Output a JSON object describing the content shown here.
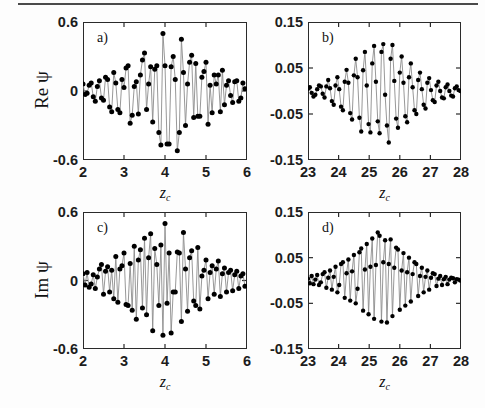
{
  "figure": {
    "background_color": "#fdfdfd",
    "rule_color": "#4a4a4a",
    "axis_color": "#2a2a2a",
    "marker_color": "#000000",
    "line_color": "#8c8c8c"
  },
  "panels": [
    {
      "letter": "a)",
      "ylabel": "Re",
      "ypsi": "ψ",
      "xlabel_base": "z",
      "xlabel_sub": "c",
      "yticks": [
        "0.6",
        "0",
        "-0.6"
      ],
      "ytick_values": [
        0.6,
        0,
        -0.6
      ],
      "xticks": [
        "2",
        "3",
        "4",
        "5",
        "6"
      ],
      "xtick_values": [
        2,
        3,
        4,
        5,
        6
      ]
    },
    {
      "letter": "b)",
      "ylabel": "",
      "ypsi": "",
      "xlabel_base": "z",
      "xlabel_sub": "c",
      "yticks": [
        "0.15",
        "0.05",
        "-0.05",
        "-0.15"
      ],
      "ytick_values": [
        0.15,
        0.05,
        -0.05,
        -0.15
      ],
      "xticks": [
        "23",
        "24",
        "25",
        "26",
        "27",
        "28"
      ],
      "xtick_values": [
        23,
        24,
        25,
        26,
        27,
        28
      ]
    },
    {
      "letter": "c)",
      "ylabel": "Im",
      "ypsi": "ψ",
      "xlabel_base": "z",
      "xlabel_sub": "c",
      "yticks": [
        "0.6",
        "0",
        "-0.6"
      ],
      "ytick_values": [
        0.6,
        0,
        -0.6
      ],
      "xticks": [
        "2",
        "3",
        "4",
        "5",
        "6"
      ],
      "xtick_values": [
        2,
        3,
        4,
        5,
        6
      ]
    },
    {
      "letter": "d)",
      "ylabel": "",
      "ypsi": "",
      "xlabel_base": "z",
      "xlabel_sub": "c",
      "yticks": [
        "0.15",
        "0.05",
        "-0.05",
        "-0.15"
      ],
      "ytick_values": [
        0.15,
        0.05,
        -0.05,
        -0.15
      ],
      "xticks": [
        "23",
        "24",
        "25",
        "26",
        "27",
        "28"
      ],
      "xtick_values": [
        23,
        24,
        25,
        26,
        27,
        28
      ]
    }
  ],
  "chart_data": [
    {
      "type": "scatter",
      "panel": "a)",
      "title": "",
      "xlabel": "z_c",
      "ylabel": "Re ψ",
      "xlim": [
        2,
        6
      ],
      "ylim": [
        -0.6,
        0.6
      ],
      "xticks": [
        2,
        3,
        4,
        5,
        6
      ],
      "yticks": [
        -0.6,
        0,
        0.6
      ],
      "grid": false,
      "legend": "none",
      "marker": "filled-circle",
      "connected": true,
      "x": [
        2.0,
        2.05,
        2.1,
        2.15,
        2.2,
        2.25,
        2.3,
        2.35,
        2.4,
        2.45,
        2.5,
        2.55,
        2.6,
        2.65,
        2.7,
        2.75,
        2.8,
        2.85,
        2.9,
        2.95,
        3.0,
        3.05,
        3.1,
        3.15,
        3.2,
        3.25,
        3.3,
        3.35,
        3.4,
        3.45,
        3.5,
        3.55,
        3.6,
        3.65,
        3.7,
        3.75,
        3.8,
        3.85,
        3.9,
        3.95,
        4.0,
        4.05,
        4.1,
        4.15,
        4.2,
        4.25,
        4.3,
        4.35,
        4.4,
        4.45,
        4.5,
        4.55,
        4.6,
        4.65,
        4.7,
        4.75,
        4.8,
        4.85,
        4.9,
        4.95,
        5.0,
        5.05,
        5.1,
        5.15,
        5.2,
        5.25,
        5.3,
        5.35,
        5.4,
        5.45,
        5.5,
        5.55,
        5.6,
        5.65,
        5.7,
        5.75,
        5.8,
        5.85,
        5.9,
        5.95
      ],
      "y": [
        0.06,
        -0.03,
        -0.02,
        0.05,
        0.07,
        -0.05,
        -0.09,
        0.04,
        0.09,
        -0.06,
        -0.08,
        0.12,
        0.1,
        -0.14,
        -0.18,
        0.16,
        0.07,
        -0.16,
        -0.19,
        0.1,
        0.03,
        0.2,
        0.22,
        -0.28,
        -0.21,
        0.04,
        0.08,
        -0.2,
        0.14,
        0.27,
        0.33,
        -0.16,
        0.06,
        0.21,
        -0.27,
        0.19,
        0.22,
        -0.36,
        -0.47,
        0.5,
        0.22,
        -0.46,
        -0.46,
        0.21,
        0.3,
        0.1,
        -0.52,
        -0.36,
        0.45,
        0.16,
        -0.3,
        0.06,
        0.25,
        0.31,
        -0.23,
        0.24,
        -0.22,
        -0.22,
        0.12,
        0.17,
        0.25,
        -0.29,
        0.05,
        -0.19,
        0.14,
        0.06,
        0.14,
        -0.18,
        0.18,
        -0.12,
        0.05,
        0.09,
        -0.04,
        -0.1,
        0.08,
        0.09,
        -0.09,
        -0.06,
        0.07,
        0.02
      ],
      "description": "Oscillatory wave packet with Gaussian-like envelope peaking near z_c = 4"
    },
    {
      "type": "scatter",
      "panel": "b)",
      "title": "",
      "xlabel": "z_c",
      "ylabel": "Re ψ",
      "xlim": [
        23,
        28
      ],
      "ylim": [
        -0.15,
        0.15
      ],
      "xticks": [
        23,
        24,
        25,
        26,
        27,
        28
      ],
      "yticks": [
        -0.15,
        -0.05,
        0.05,
        0.15
      ],
      "grid": false,
      "legend": "none",
      "marker": "filled-circle",
      "connected": true,
      "x": [
        23.0,
        23.06,
        23.12,
        23.18,
        23.24,
        23.3,
        23.36,
        23.42,
        23.48,
        23.54,
        23.6,
        23.66,
        23.72,
        23.78,
        23.84,
        23.9,
        23.96,
        24.02,
        24.08,
        24.14,
        24.2,
        24.26,
        24.32,
        24.38,
        24.44,
        24.5,
        24.56,
        24.62,
        24.68,
        24.74,
        24.8,
        24.86,
        24.92,
        24.98,
        25.04,
        25.1,
        25.16,
        25.22,
        25.28,
        25.34,
        25.4,
        25.46,
        25.52,
        25.58,
        25.64,
        25.7,
        25.76,
        25.82,
        25.88,
        25.94,
        26.0,
        26.06,
        26.12,
        26.18,
        26.24,
        26.3,
        26.36,
        26.42,
        26.48,
        26.54,
        26.6,
        26.66,
        26.72,
        26.78,
        26.84,
        26.9,
        26.96,
        27.02,
        27.08,
        27.14,
        27.2,
        27.26,
        27.32,
        27.38,
        27.44,
        27.5,
        27.56,
        27.62,
        27.68,
        27.74,
        27.8,
        27.86,
        27.92,
        27.98
      ],
      "y": [
        0.005,
        0.008,
        -0.004,
        -0.012,
        -0.008,
        0.004,
        0.012,
        0.01,
        -0.006,
        -0.014,
        0.01,
        0.024,
        0.006,
        -0.022,
        -0.03,
        0.012,
        0.03,
        0.004,
        -0.034,
        -0.042,
        0.02,
        0.046,
        0.018,
        -0.048,
        -0.062,
        0.034,
        0.07,
        0.03,
        -0.058,
        -0.088,
        0.045,
        0.085,
        0.012,
        -0.072,
        -0.09,
        0.06,
        0.098,
        0.02,
        -0.066,
        -0.092,
        0.085,
        0.102,
        -0.008,
        -0.075,
        -0.112,
        0.07,
        0.1,
        0.022,
        -0.06,
        -0.08,
        0.04,
        0.075,
        0.018,
        -0.055,
        -0.068,
        0.03,
        0.06,
        0.008,
        -0.042,
        -0.05,
        0.024,
        0.04,
        0.004,
        -0.03,
        -0.038,
        0.018,
        0.028,
        0.002,
        -0.02,
        -0.024,
        0.012,
        0.02,
        0.0,
        -0.014,
        -0.016,
        0.008,
        0.014,
        0.0,
        -0.01,
        -0.012,
        0.006,
        0.01,
        0.002,
        0.0
      ],
      "description": "Oscillatory wave packet with Gaussian-like envelope peaking near z_c = 25.4, amplitude reduced ~4x relative to panel a"
    },
    {
      "type": "scatter",
      "panel": "c)",
      "title": "",
      "xlabel": "z_c",
      "ylabel": "Im ψ",
      "xlim": [
        2,
        6
      ],
      "ylim": [
        -0.6,
        0.6
      ],
      "xticks": [
        2,
        3,
        4,
        5,
        6
      ],
      "yticks": [
        -0.6,
        0,
        0.6
      ],
      "grid": false,
      "legend": "none",
      "marker": "filled-circle",
      "connected": true,
      "x": [
        2.0,
        2.05,
        2.1,
        2.15,
        2.2,
        2.25,
        2.3,
        2.35,
        2.4,
        2.45,
        2.5,
        2.55,
        2.6,
        2.65,
        2.7,
        2.75,
        2.8,
        2.85,
        2.9,
        2.95,
        3.0,
        3.05,
        3.1,
        3.15,
        3.2,
        3.25,
        3.3,
        3.35,
        3.4,
        3.45,
        3.5,
        3.55,
        3.6,
        3.65,
        3.7,
        3.75,
        3.8,
        3.85,
        3.9,
        3.95,
        4.0,
        4.05,
        4.1,
        4.15,
        4.2,
        4.25,
        4.3,
        4.35,
        4.4,
        4.45,
        4.5,
        4.55,
        4.6,
        4.65,
        4.7,
        4.75,
        4.8,
        4.85,
        4.9,
        4.95,
        5.0,
        5.05,
        5.1,
        5.15,
        5.2,
        5.25,
        5.3,
        5.35,
        5.4,
        5.45,
        5.5,
        5.55,
        5.6,
        5.65,
        5.7,
        5.75,
        5.8,
        5.85,
        5.9,
        5.95
      ],
      "y": [
        0.06,
        -0.04,
        0.07,
        -0.06,
        -0.03,
        0.05,
        -0.07,
        0.03,
        0.1,
        0.14,
        -0.12,
        0.08,
        0.12,
        -0.1,
        0.09,
        -0.16,
        0.21,
        -0.19,
        0.1,
        0.13,
        0.24,
        -0.21,
        -0.22,
        0.15,
        -0.26,
        0.3,
        -0.34,
        0.18,
        0.27,
        -0.24,
        0.37,
        -0.3,
        0.2,
        0.41,
        -0.44,
        0.28,
        0.14,
        -0.22,
        0.31,
        -0.48,
        0.5,
        -0.2,
        0.24,
        -0.46,
        -0.1,
        -0.1,
        0.25,
        0.24,
        -0.36,
        0.42,
        0.1,
        -0.27,
        0.2,
        0.26,
        -0.18,
        -0.22,
        0.29,
        -0.25,
        0.04,
        0.09,
        0.18,
        -0.16,
        0.07,
        0.13,
        -0.12,
        0.1,
        0.17,
        -0.14,
        0.06,
        0.11,
        -0.1,
        0.07,
        0.09,
        -0.09,
        0.05,
        0.08,
        -0.07,
        0.04,
        0.06,
        -0.05
      ],
      "description": "Imaginary part oscillatory wave packet, Gaussian envelope peaking near z_c = 4, phase-shifted relative to panel a"
    },
    {
      "type": "scatter",
      "panel": "d)",
      "title": "",
      "xlabel": "z_c",
      "ylabel": "Im ψ",
      "xlim": [
        23,
        28
      ],
      "ylim": [
        -0.15,
        0.15
      ],
      "xticks": [
        23,
        24,
        25,
        26,
        27,
        28
      ],
      "yticks": [
        -0.15,
        -0.05,
        0.05,
        0.15
      ],
      "grid": false,
      "legend": "none",
      "marker": "filled-circle",
      "connected": true,
      "x": [
        23.0,
        23.06,
        23.12,
        23.18,
        23.24,
        23.3,
        23.36,
        23.42,
        23.48,
        23.54,
        23.6,
        23.66,
        23.72,
        23.78,
        23.84,
        23.9,
        23.96,
        24.02,
        24.08,
        24.14,
        24.2,
        24.26,
        24.32,
        24.38,
        24.44,
        24.5,
        24.56,
        24.62,
        24.68,
        24.74,
        24.8,
        24.86,
        24.92,
        24.98,
        25.04,
        25.1,
        25.16,
        25.22,
        25.28,
        25.34,
        25.4,
        25.46,
        25.52,
        25.58,
        25.64,
        25.7,
        25.76,
        25.82,
        25.88,
        25.94,
        26.0,
        26.06,
        26.12,
        26.18,
        26.24,
        26.3,
        26.36,
        26.42,
        26.48,
        26.54,
        26.6,
        26.66,
        26.72,
        26.78,
        26.84,
        26.9,
        26.96,
        27.02,
        27.08,
        27.14,
        27.2,
        27.26,
        27.32,
        27.38,
        27.44,
        27.5,
        27.56,
        27.62,
        27.68,
        27.74,
        27.8,
        27.86,
        27.92,
        27.98
      ],
      "y": [
        0.004,
        -0.006,
        0.01,
        -0.008,
        0.002,
        0.012,
        -0.01,
        -0.004,
        0.014,
        0.018,
        -0.016,
        0.006,
        0.022,
        -0.02,
        0.008,
        0.03,
        -0.026,
        -0.01,
        0.036,
        0.04,
        -0.038,
        0.016,
        0.046,
        -0.044,
        0.02,
        0.056,
        -0.05,
        -0.018,
        0.062,
        0.07,
        -0.066,
        0.024,
        0.08,
        -0.074,
        0.03,
        0.092,
        -0.084,
        0.034,
        0.105,
        0.098,
        -0.09,
        0.04,
        0.088,
        -0.092,
        0.036,
        0.09,
        -0.078,
        0.028,
        0.072,
        0.068,
        -0.064,
        0.022,
        0.06,
        -0.055,
        0.018,
        0.05,
        -0.046,
        0.014,
        0.04,
        0.036,
        -0.034,
        0.01,
        0.028,
        -0.026,
        0.008,
        0.022,
        -0.02,
        0.006,
        0.016,
        0.014,
        -0.012,
        0.004,
        0.01,
        -0.01,
        0.003,
        0.008,
        -0.008,
        0.002,
        0.006,
        0.005,
        -0.004,
        0.003,
        0.002,
        0.0
      ],
      "description": "Imaginary part oscillatory wave packet, Gaussian envelope peaking near z_c = 25.3, amplitude reduced ~4x relative to panel c"
    }
  ]
}
